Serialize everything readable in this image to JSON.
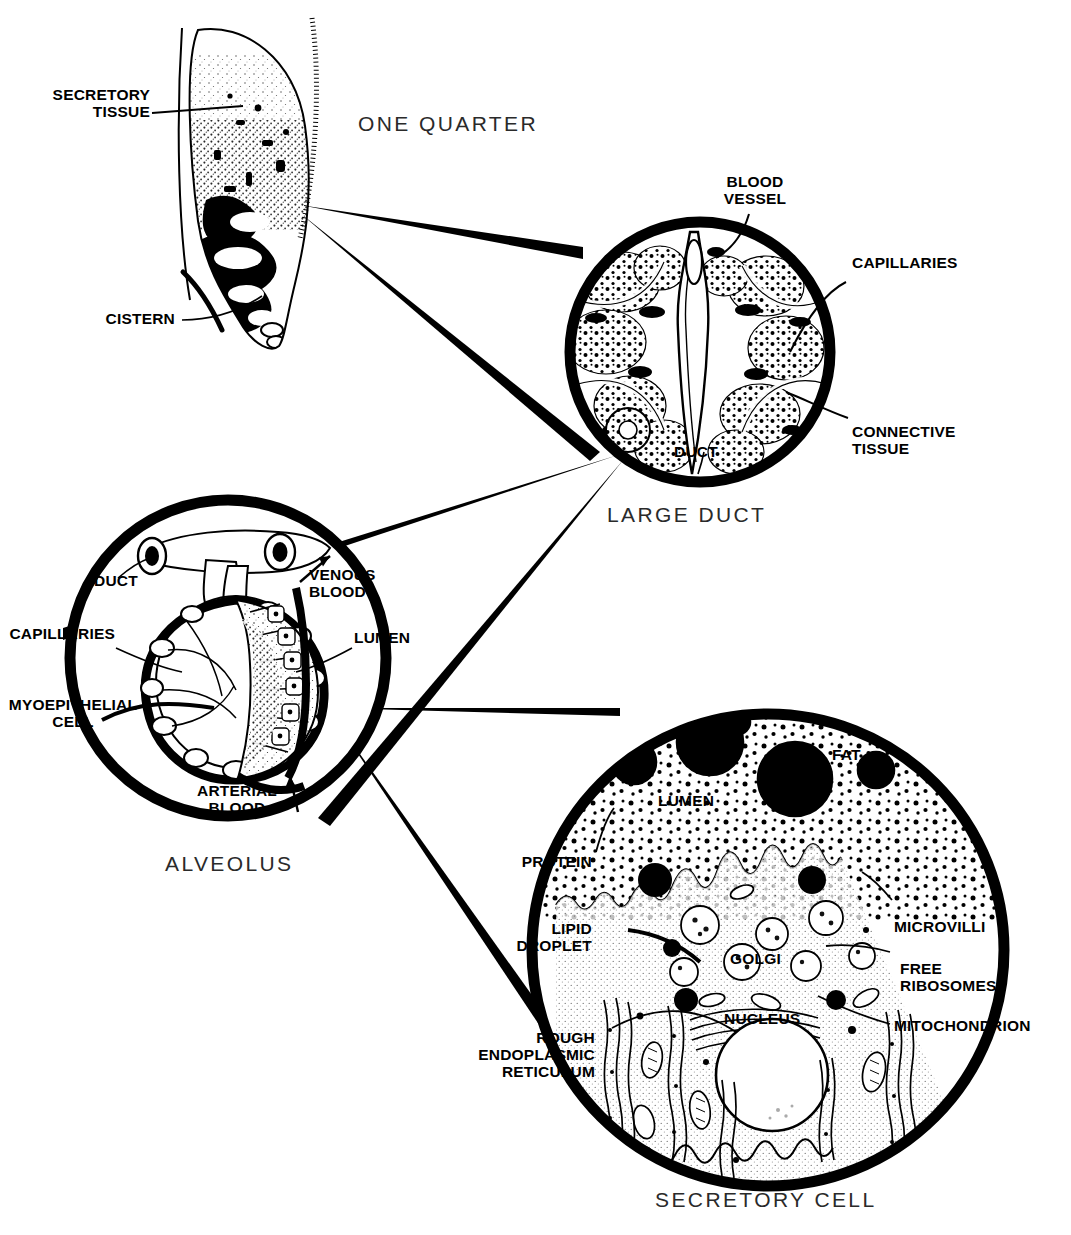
{
  "figure": {
    "ink_color": "#000000",
    "background": "#ffffff",
    "caption_color": "#2a2a2a"
  },
  "panels": [
    {
      "id": "one-quarter",
      "caption": "ONE QUARTER",
      "labels": [
        {
          "id": "secretory-tissue",
          "text": "SECRETORY\nTISSUE"
        },
        {
          "id": "cistern",
          "text": "CISTERN"
        }
      ]
    },
    {
      "id": "large-duct",
      "caption": "LARGE DUCT",
      "labels": [
        {
          "id": "blood-vessel",
          "text": "BLOOD\nVESSEL"
        },
        {
          "id": "capillaries",
          "text": "CAPILLARIES"
        },
        {
          "id": "connective-tissue",
          "text": "CONNECTIVE\nTISSUE"
        },
        {
          "id": "duct",
          "text": "DUCT"
        }
      ]
    },
    {
      "id": "alveolus",
      "caption": "ALVEOLUS",
      "labels": [
        {
          "id": "duct",
          "text": "DUCT"
        },
        {
          "id": "venous-blood",
          "text": "VENOUS\nBLOOD"
        },
        {
          "id": "capillaries",
          "text": "CAPILLARIES"
        },
        {
          "id": "lumen",
          "text": "LUMEN"
        },
        {
          "id": "myoepithelial-cell",
          "text": "MYOEPITHELIAL\nCELL"
        },
        {
          "id": "arterial-blood",
          "text": "ARTERIAL\nBLOOD"
        }
      ]
    },
    {
      "id": "secretory-cell",
      "caption": "SECRETORY CELL",
      "labels": [
        {
          "id": "fat",
          "text": "FAT"
        },
        {
          "id": "lumen",
          "text": "LUMEN"
        },
        {
          "id": "protein",
          "text": "PROTEIN"
        },
        {
          "id": "lipid-droplet",
          "text": "LIPID\nDROPLET"
        },
        {
          "id": "golgi",
          "text": "GOLGI"
        },
        {
          "id": "nucleus",
          "text": "NUCLEUS"
        },
        {
          "id": "microvilli",
          "text": "MICROVILLI"
        },
        {
          "id": "free-ribosomes",
          "text": "FREE\nRIBOSOMES"
        },
        {
          "id": "mitochondrion",
          "text": "MITOCHONDRION"
        },
        {
          "id": "rough-er",
          "text": "ROUGH\nENDOPLASMIC\nRETICULUM"
        }
      ]
    }
  ]
}
